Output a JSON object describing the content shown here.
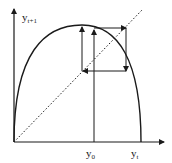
{
  "diagram": {
    "type": "cobweb-plot",
    "y_axis_label": "y",
    "y_axis_subscript": "t+1",
    "x_axis_label": "y",
    "x_axis_subscript": "t",
    "x0_label": "y",
    "x0_subscript": "0",
    "curve": "parabola (logistic map)",
    "diagonal": "dotted identity line",
    "colors": {
      "ink": "#1a1a1a",
      "background": "#ffffff"
    }
  }
}
